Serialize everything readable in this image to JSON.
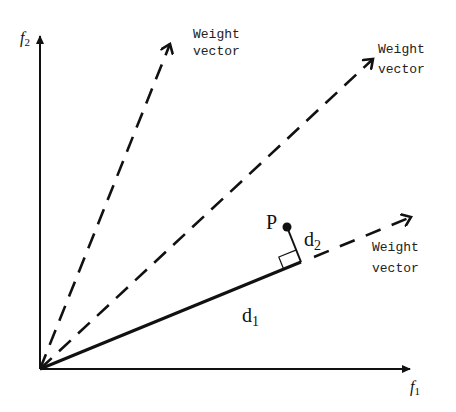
{
  "diagram": {
    "axes": {
      "x_label": "f",
      "x_subscript": "1",
      "y_label": "f",
      "y_subscript": "2"
    },
    "weight_vectors": [
      {
        "label_line1": "Weight",
        "label_line2": "vector"
      },
      {
        "label_line1": "Weight",
        "label_line2": "vector"
      },
      {
        "label_line1": "Weight",
        "label_line2": "vector"
      }
    ],
    "point": {
      "label": "P"
    },
    "distances": {
      "d1": {
        "base": "d",
        "subscript": "1"
      },
      "d2": {
        "base": "d",
        "subscript": "2"
      }
    },
    "colors": {
      "stroke": "#111111",
      "background": "#ffffff"
    }
  }
}
